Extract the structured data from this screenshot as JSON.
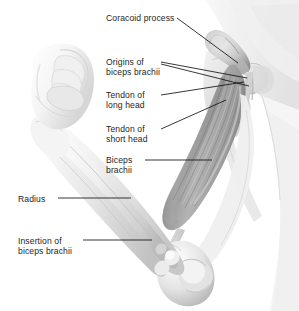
{
  "figure": {
    "background_color": "#ffffff",
    "text_color": "#1e1e1e",
    "style": "grayscale anatomical illustration"
  },
  "labels": [
    {
      "id": "coracoid-process",
      "text": "Coracoid process",
      "lines": [
        "Coracoid process"
      ],
      "x": 106,
      "y": 13
    },
    {
      "id": "origins-biceps",
      "text": "Origins of biceps brachii",
      "lines": [
        "Origins of",
        "biceps brachii"
      ],
      "x": 106,
      "y": 57
    },
    {
      "id": "tendon-long-head",
      "text": "Tendon of long head",
      "lines": [
        "Tendon of",
        "long head"
      ],
      "x": 106,
      "y": 90
    },
    {
      "id": "tendon-short-head",
      "text": "Tendon of short head",
      "lines": [
        "Tendon of",
        "short head"
      ],
      "x": 106,
      "y": 124
    },
    {
      "id": "biceps-brachii",
      "text": "Biceps brachii",
      "lines": [
        "Biceps",
        "brachii"
      ],
      "x": 106,
      "y": 155
    },
    {
      "id": "radius",
      "text": "Radius",
      "lines": [
        "Radius"
      ],
      "x": 18,
      "y": 194
    },
    {
      "id": "insertion-biceps",
      "text": "Insertion of biceps brachii",
      "lines": [
        "Insertion of",
        "biceps brachii"
      ],
      "x": 18,
      "y": 236
    }
  ],
  "anatomy_parts": [
    {
      "name": "clenched-fist"
    },
    {
      "name": "forearm"
    },
    {
      "name": "radius-bone"
    },
    {
      "name": "ulna-bone"
    },
    {
      "name": "elbow-joint"
    },
    {
      "name": "biceps-brachii-muscle"
    },
    {
      "name": "long-head-tendon"
    },
    {
      "name": "short-head-tendon"
    },
    {
      "name": "coracoid-process-bone"
    },
    {
      "name": "scapula"
    },
    {
      "name": "humerus-head"
    },
    {
      "name": "torso-shoulder"
    }
  ],
  "palette": {
    "background": "#ffffff",
    "skin_light": "#f2f2f2",
    "skin_mid": "#d9d9d9",
    "bone_light": "#fbfbfb",
    "bone_shadow": "#c9c9c9",
    "muscle_light": "#cfcfcf",
    "muscle_mid": "#a8a8a8",
    "muscle_dark": "#7d7d7d",
    "leader_line": "#141414"
  }
}
